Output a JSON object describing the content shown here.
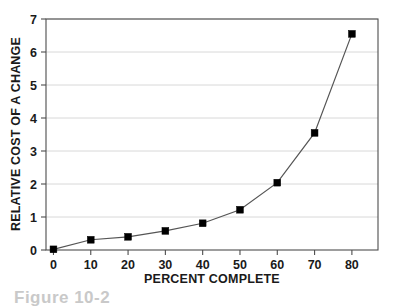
{
  "chart_data": {
    "type": "line",
    "title": "",
    "xlabel": "PERCENT COMPLETE",
    "ylabel": "RELATIVE COST OF A CHANGE",
    "x": [
      0,
      10,
      20,
      30,
      40,
      50,
      60,
      70,
      80
    ],
    "values": [
      0.02,
      0.31,
      0.4,
      0.58,
      0.81,
      1.22,
      2.04,
      3.55,
      6.55
    ],
    "xlim": [
      -2,
      87
    ],
    "ylim": [
      0,
      7
    ],
    "xticks": [
      "0",
      "10",
      "20",
      "30",
      "40",
      "50",
      "60",
      "70",
      "80"
    ],
    "yticks": [
      "0",
      "1",
      "2",
      "3",
      "4",
      "5",
      "6",
      "7"
    ],
    "grid": "horizontal",
    "legend": "none",
    "marker": "filled-square",
    "line_color": "#555555",
    "marker_color": "#000000",
    "grid_color": "#d8d8d8",
    "frame_color": "#4d4d4d",
    "background_color": "#ffffff"
  },
  "caption": {
    "text": "Figure 10-2"
  }
}
